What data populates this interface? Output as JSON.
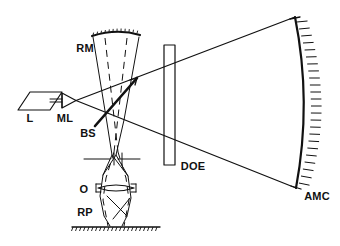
{
  "figure": {
    "background_color": "#ffffff",
    "line_color": "#111111",
    "width": 340,
    "height": 246
  },
  "labels": {
    "laser": "L",
    "microscope_lens": "ML",
    "beam_splitter": "BS",
    "reference_mirror": "RM",
    "diffractive_optical_element": "DOE",
    "objective": "O",
    "reference_plane": "RP",
    "aspheric_mirror_under_test": "AMC"
  },
  "components": [
    {
      "id": "L",
      "label": "L",
      "name": "laser-source",
      "shape": "parallelogram",
      "label_x": 30,
      "label_y": 122
    },
    {
      "id": "ML",
      "label": "ML",
      "name": "microscope-lens",
      "shape": "triangle-with-bar",
      "label_x": 61,
      "label_y": 122
    },
    {
      "id": "BS",
      "label": "BS",
      "name": "beam-splitter",
      "shape": "thick-diagonal-line",
      "label_x": 83,
      "label_y": 134
    },
    {
      "id": "RM",
      "label": "RM",
      "name": "reference-mirror",
      "shape": "concave-arc-hatched",
      "label_x": 75,
      "label_y": 52
    },
    {
      "id": "DOE",
      "label": "DOE",
      "name": "diffractive-optical-element",
      "shape": "vertical-rectangle",
      "label_x": 178,
      "label_y": 166
    },
    {
      "id": "O",
      "label": "O",
      "name": "objective-lens",
      "shape": "lens",
      "label_x": 82,
      "label_y": 194
    },
    {
      "id": "RP",
      "label": "RP",
      "name": "reference-plane",
      "shape": "hatched-baseline",
      "label_x": 80,
      "label_y": 216
    },
    {
      "id": "AMC",
      "label": "AMC",
      "name": "aspheric-mirror",
      "shape": "large-concave-arc-hatched",
      "label_x": 303,
      "label_y": 197
    }
  ]
}
